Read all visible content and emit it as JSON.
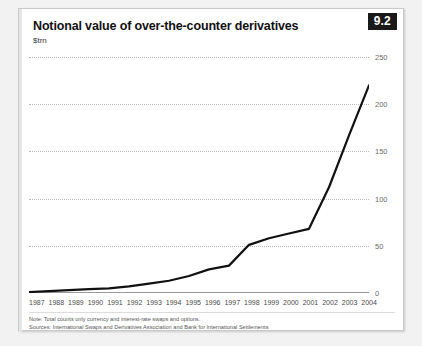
{
  "card": {
    "badge": "9.2",
    "title": "Notional value of over-the-counter derivatives",
    "subtitle": "$trn",
    "notes": [
      "Note: Total counts only currency and interest-rate swaps and options.",
      "Sources: International Swaps and Derivatives Association and Bank for International Settlements"
    ]
  },
  "colors": {
    "line": "#111111",
    "gridline": "#b9b9b9",
    "axis": "#9a9a9a",
    "badge_background": "#1a1a1a",
    "badge_text": "#ffffff",
    "card_background": "#ffffff",
    "page_background": "#f2f2f2"
  },
  "chart_data": {
    "type": "line",
    "title": "Notional value of over-the-counter derivatives",
    "subtitle": "$trn",
    "xlabel": "",
    "ylabel": "$trn",
    "ylim": [
      0,
      250
    ],
    "yticks": [
      0,
      50,
      100,
      150,
      200,
      250
    ],
    "grid": true,
    "legend": "none",
    "categories": [
      "1987",
      "1988",
      "1989",
      "1990",
      "1991",
      "1992",
      "1993",
      "1994",
      "1995",
      "1996",
      "1997",
      "1998",
      "1999",
      "2000",
      "2001",
      "2002",
      "2003",
      "2004"
    ],
    "series": [
      {
        "name": "Notional value of OTC derivatives",
        "values": [
          1,
          2,
          3,
          4,
          5,
          7,
          10,
          13,
          18,
          25,
          29,
          51,
          58,
          63,
          68,
          112,
          167,
          220
        ]
      }
    ]
  }
}
